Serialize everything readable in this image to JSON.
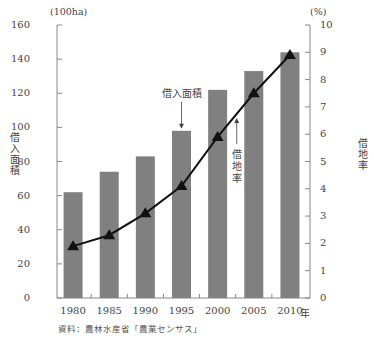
{
  "chart_data": {
    "type": "bar+line",
    "title": "",
    "categories": [
      "1980",
      "1985",
      "1990",
      "1995",
      "2000",
      "2005",
      "2010"
    ],
    "series": [
      {
        "name": "借入面積",
        "type": "bar",
        "axis": "left",
        "unit": "100ha",
        "color": "#808080",
        "values": [
          62,
          74,
          83,
          98,
          122,
          133,
          144
        ]
      },
      {
        "name": "借地率",
        "type": "line",
        "axis": "right",
        "unit": "%",
        "marker": "triangle",
        "color": "#111111",
        "values": [
          1.9,
          2.3,
          3.1,
          4.1,
          5.9,
          7.5,
          8.9
        ]
      }
    ],
    "xlabel": "年",
    "ylabel_left": "借入面積",
    "ylabel_right": "借地率",
    "ylim_left": [
      0,
      160
    ],
    "ylim_right": [
      0,
      10
    ],
    "left_ticks": [
      "0",
      "20",
      "40",
      "60",
      "80",
      "100",
      "120",
      "140",
      "160"
    ],
    "right_ticks": [
      "0",
      "1",
      "2",
      "3",
      "4",
      "5",
      "6",
      "7",
      "8",
      "9",
      "10"
    ],
    "left_unit": "(100ha)",
    "right_unit": "(%)",
    "annotations": [
      {
        "text": "借入面積",
        "points_to": "1995 bar"
      },
      {
        "text": "借地率",
        "points_to": "line between 2000 and 2005"
      }
    ],
    "grid": false,
    "legend": "none (inline annotations)",
    "source": "資料：農林水産省「農業センサス」"
  },
  "labels": {
    "left_unit": "(100ha)",
    "right_unit": "(%)",
    "left_axis_title": "借入面積",
    "right_axis_title": "借地率",
    "bar_annotation": "借入面積",
    "line_annotation": "借地率",
    "year_suffix": "年",
    "source": "資料：農林水産省「農業センサス」"
  }
}
